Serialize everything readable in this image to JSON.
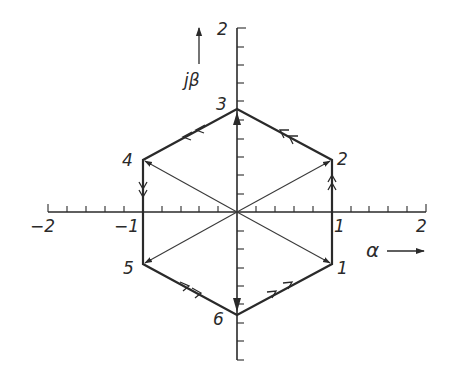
{
  "diagram": {
    "title": "",
    "axes": {
      "x": {
        "label": "α",
        "ticks": [
          "-2",
          "-1",
          "1",
          "2"
        ],
        "range": [
          -2,
          2
        ]
      },
      "y": {
        "label": "jβ",
        "ticks": [
          "2"
        ],
        "range": [
          -2,
          2
        ]
      }
    },
    "vertices": [
      {
        "id": "1",
        "label": "1"
      },
      {
        "id": "2",
        "label": "2"
      },
      {
        "id": "3",
        "label": "3"
      },
      {
        "id": "4",
        "label": "4"
      },
      {
        "id": "5",
        "label": "5"
      },
      {
        "id": "6",
        "label": "6"
      }
    ],
    "labels": {
      "x_neg2": "−2",
      "x_neg1": "−1",
      "x_pos1": "1",
      "x_pos2": "2",
      "y_pos2": "2",
      "alpha": "α",
      "jbeta": "jβ"
    },
    "colors": {
      "ink": "#2a2a2a",
      "background": "#ffffff"
    }
  }
}
